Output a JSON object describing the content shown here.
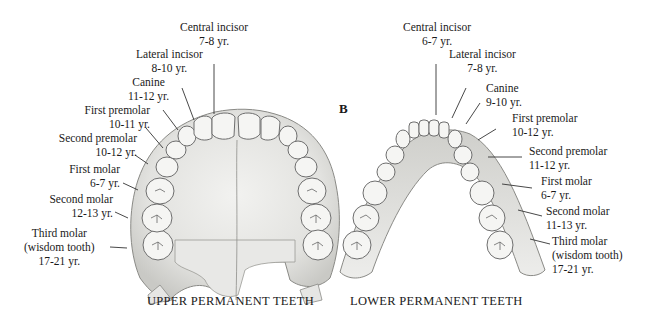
{
  "panel_letter": "B",
  "upper": {
    "caption": "UPPER PERMANENT TEETH",
    "labels": [
      {
        "name": "Central incisor",
        "age": "7-8 yr."
      },
      {
        "name": "Lateral incisor",
        "age": "8-10 yr."
      },
      {
        "name": "Canine",
        "age": "11-12 yr."
      },
      {
        "name": "First premolar",
        "age": "10-11 yr."
      },
      {
        "name": "Second premolar",
        "age": "10-12 yr."
      },
      {
        "name": "First molar",
        "age": "6-7 yr."
      },
      {
        "name": "Second molar",
        "age": "12-13 yr."
      },
      {
        "name": "Third molar",
        "note": "(wisdom tooth)",
        "age": "17-21 yr."
      }
    ]
  },
  "lower": {
    "caption": "LOWER PERMANENT TEETH",
    "labels": [
      {
        "name": "Central incisor",
        "age": "6-7 yr."
      },
      {
        "name": "Lateral incisor",
        "age": "7-8 yr."
      },
      {
        "name": "Canine",
        "age": "9-10 yr."
      },
      {
        "name": "First premolar",
        "age": "10-12 yr."
      },
      {
        "name": "Second premolar",
        "age": "11-12 yr."
      },
      {
        "name": "First molar",
        "age": "6-7 yr."
      },
      {
        "name": "Second molar",
        "age": "11-13 yr."
      },
      {
        "name": "Third molar",
        "note": "(wisdom tooth)",
        "age": "17-21 yr."
      }
    ]
  },
  "colors": {
    "tooth_fill": "#f4f4f2",
    "tooth_stroke": "#6e6e6e",
    "palate": "#e4e4e2",
    "bone_shade": "#cfcfcc",
    "leader": "#333333"
  }
}
